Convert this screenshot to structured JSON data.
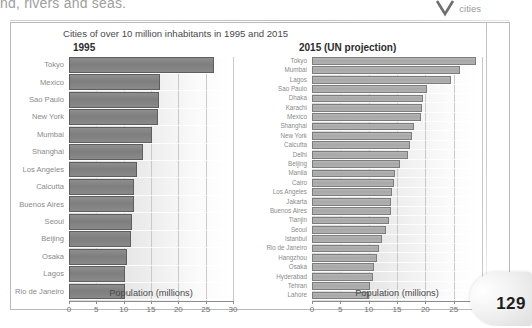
{
  "page": {
    "bleed_text": "nd, rivers and seas.",
    "tab_label": "cities",
    "page_number": "129"
  },
  "figure": {
    "title": "Cities of over 10 million inhabitants in 1995 and 2015"
  },
  "chart_data": [
    {
      "type": "bar",
      "orientation": "horizontal",
      "title": "1995",
      "xlabel": "Population (millions)",
      "ylabel": "",
      "xlim": [
        0,
        30
      ],
      "xticks": [
        0,
        5,
        10,
        15,
        20,
        25,
        30
      ],
      "grid": true,
      "legend": "none",
      "bar_color": "#7e7e7e",
      "categories": [
        "Tokyo",
        "Mexico",
        "Sao Paulo",
        "New York",
        "Mumbai",
        "Shanghai",
        "Los Angeles",
        "Calcutta",
        "Buenos Aires",
        "Seoul",
        "Beijing",
        "Osaka",
        "Lagos",
        "Rio de Janeiro"
      ],
      "values": [
        26.5,
        16.6,
        16.5,
        16.3,
        15.1,
        13.6,
        12.4,
        11.9,
        11.8,
        11.6,
        11.3,
        10.6,
        10.3,
        10.2
      ]
    },
    {
      "type": "bar",
      "orientation": "horizontal",
      "title": "2015 (UN projection)",
      "xlabel": "Population (millions)",
      "ylabel": "",
      "xlim": [
        0,
        30
      ],
      "xticks": [
        0,
        5,
        10,
        15,
        20,
        25,
        30
      ],
      "grid": true,
      "legend": "none",
      "bar_color": "#a8a8a8",
      "categories": [
        "Tokyo",
        "Mumbai",
        "Lagos",
        "Sao Paulo",
        "Dhaka",
        "Karachi",
        "Mexico",
        "Shanghai",
        "New York",
        "Calcutta",
        "Delhi",
        "Beijing",
        "Manila",
        "Cairo",
        "Los Angeles",
        "Jakarta",
        "Buenos Aires",
        "Tianjin",
        "Seoul",
        "Istanbul",
        "Rio de Janeiro",
        "Hangzhou",
        "Osaka",
        "Hyderabad",
        "Tehran",
        "Lahore"
      ],
      "values": [
        28.9,
        26.2,
        24.6,
        20.3,
        19.5,
        19.4,
        19.2,
        18.0,
        17.6,
        17.3,
        17.0,
        15.6,
        14.7,
        14.4,
        14.2,
        13.9,
        13.9,
        13.5,
        13.1,
        12.4,
        11.9,
        11.5,
        11.0,
        10.7,
        10.3,
        10.1
      ]
    }
  ]
}
